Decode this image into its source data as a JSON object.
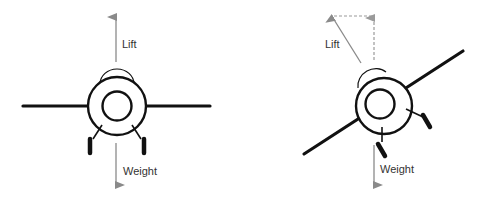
{
  "diagram": {
    "type": "force-diagram",
    "colors": {
      "airframe": "#111111",
      "force_arrow": "#8a8a8a",
      "component_dashed": "#9a9a9a",
      "label": "#333333",
      "background": "#ffffff"
    },
    "panels": [
      {
        "id": "level",
        "forces": [
          {
            "name": "lift",
            "label": "Lift",
            "direction": "up"
          },
          {
            "name": "weight",
            "label": "Weight",
            "direction": "down"
          }
        ]
      },
      {
        "id": "banked",
        "forces": [
          {
            "name": "lift",
            "label": "Lift",
            "direction": "tilted up-left"
          },
          {
            "name": "lift-vertical-component",
            "label": "",
            "direction": "up",
            "style": "dashed"
          },
          {
            "name": "weight",
            "label": "Weight",
            "direction": "down"
          }
        ]
      }
    ]
  }
}
